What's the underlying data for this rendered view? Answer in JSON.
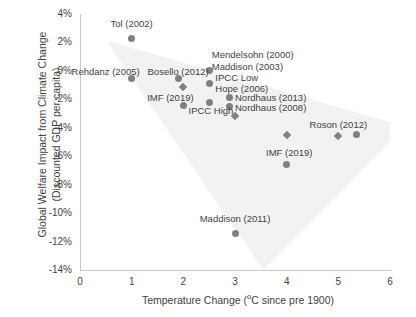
{
  "chart_data": {
    "type": "scatter",
    "title": "",
    "xlabel": "Temperature Change (ºC since pre 1900)",
    "ylabel_line1": "Global Welfare Impact from Climate Change",
    "ylabel_line2": "(Discounted GDP per capita)",
    "xlim": [
      0,
      6
    ],
    "ylim": [
      -14,
      4
    ],
    "xticks": [
      "0",
      "1",
      "2",
      "3",
      "4",
      "5",
      "6"
    ],
    "xtick_values": [
      0,
      1,
      2,
      3,
      4,
      5,
      6
    ],
    "yticks": [
      "4%",
      "2%",
      "0%",
      "-2%",
      "-4%",
      "-6%",
      "-8%",
      "-10%",
      "-12%",
      "-14%"
    ],
    "ytick_values": [
      4,
      2,
      0,
      -2,
      -4,
      -6,
      -8,
      -10,
      -12,
      -14
    ],
    "grid": false,
    "legend": "none",
    "marker_color": "#808080",
    "axis_color": "#c9c9c9",
    "text_color": "#3f3f3f",
    "shaded_region_color": "#f2f2f2",
    "shaded_region_note": "Light grey wedge spanning from upper-left (~0.6°C, 2%) widening downward-right to the lower-right of the plot area",
    "points": [
      {
        "label": "Tol (2002)",
        "x": 1.0,
        "y": 2.3,
        "marker": "circle"
      },
      {
        "label": "Rehdanz (2005)",
        "x": 1.0,
        "y": -0.5,
        "marker": "circle"
      },
      {
        "label": "Bosello (2012)",
        "x": 1.9,
        "y": -0.5,
        "marker": "circle"
      },
      {
        "label": "IMF (2019)",
        "x": 2.0,
        "y": -1.1,
        "marker": "diamond"
      },
      {
        "label": "IPCC High",
        "x": 2.0,
        "y": -2.4,
        "marker": "circle"
      },
      {
        "label": "Mendelsohn (2000)",
        "x": 2.5,
        "y": 0.0,
        "marker": "circle"
      },
      {
        "label": "Maddison (2003)",
        "x": 2.5,
        "y": -0.9,
        "marker": "circle"
      },
      {
        "label": "Hope (2006)",
        "x": 2.5,
        "y": -2.2,
        "marker": "circle"
      },
      {
        "label": "Nordhaus (2013)",
        "x": 2.9,
        "y": -1.9,
        "marker": "circle"
      },
      {
        "label": "Nordhaus (2008)",
        "x": 2.9,
        "y": -2.5,
        "marker": "circle"
      },
      {
        "label": "",
        "x": 3.0,
        "y": -3.2,
        "marker": "diamond"
      },
      {
        "label": "Maddison (2011)",
        "x": 3.0,
        "y": -11.4,
        "marker": "circle"
      },
      {
        "label": "",
        "x": 4.0,
        "y": -4.5,
        "marker": "diamond"
      },
      {
        "label": "IMF (2019)",
        "x": 4.0,
        "y": -6.6,
        "marker": "circle"
      },
      {
        "label": "",
        "x": 5.0,
        "y": -4.6,
        "marker": "diamond"
      },
      {
        "label": "Roson (2012)",
        "x": 5.35,
        "y": -4.5,
        "marker": "circle"
      }
    ],
    "annotations": [
      {
        "text": "Tol (2002)",
        "x": 1.0,
        "y": 3.3
      },
      {
        "text": "Rehdanz (2005)",
        "x": 1.0,
        "y": -0.1
      },
      {
        "text": "Bosello (2012)",
        "x": 1.9,
        "y": -0.1
      },
      {
        "text": "Mendelsohn (2000)",
        "x": 2.55,
        "y": 1.1
      },
      {
        "text": "Maddison (2003)",
        "x": 2.55,
        "y": 0.3
      },
      {
        "text": "IPCC Low",
        "x": 2.62,
        "y": -0.5
      },
      {
        "text": "Hope (2006)",
        "x": 2.62,
        "y": -1.3
      },
      {
        "text": "IMF (2019)",
        "x": 1.75,
        "y": -1.9
      },
      {
        "text": "IPCC High",
        "x": 2.1,
        "y": -2.8
      },
      {
        "text": "Nordhaus (2013)",
        "x": 3.0,
        "y": -1.9
      },
      {
        "text": "Nordhaus (2008)",
        "x": 3.0,
        "y": -2.6
      },
      {
        "text": "Roson (2012)",
        "x": 5.0,
        "y": -3.8
      },
      {
        "text": "IMF (2019)",
        "x": 4.05,
        "y": -5.8
      },
      {
        "text": "Maddison (2011)",
        "x": 3.0,
        "y": -10.4
      }
    ]
  }
}
